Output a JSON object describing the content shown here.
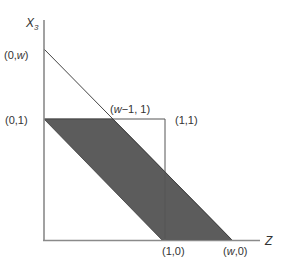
{
  "colors": {
    "shade": "#5c5c5c",
    "axis": "#8a8a8a",
    "line": "#444444",
    "box": "#555555"
  },
  "axes": {
    "y_label": "X",
    "y_label_sub": "3",
    "x_label": "Z"
  },
  "points": {
    "zero_w": "(0,w)",
    "zero_one": "(0,1)",
    "w_minus_one_one": "(w−1, 1)",
    "one_one": "(1,1)",
    "one_zero": "(1,0)",
    "w_zero": "(w,0)"
  },
  "label_parts": {
    "zero_w_pre": "(0,",
    "zero_w_var": "w",
    "zero_w_post": ")",
    "wm1_pre": "(",
    "wm1_var": "w",
    "wm1_post": "−1, 1)",
    "w0_pre": "(",
    "w0_var": "w",
    "w0_post": ",0)"
  }
}
